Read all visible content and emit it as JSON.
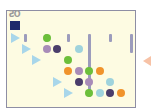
{
  "game": {
    "logo_text": "ƧO",
    "colors": {
      "board_bg": "#fdfbe2",
      "border": "#8e8ea4",
      "selected_square": "#1f2a6b",
      "launcher_triangle": "#a8d6ea",
      "exit_arrow": "#f7c2a6",
      "bar": "#9c9cbc",
      "green": "#6cbf3a",
      "purple": "#a88bb8",
      "dark_purple": "#4a3d6b",
      "light_blue": "#9fd3dc",
      "orange": "#f0932b"
    },
    "launchers": [
      {
        "row": 1,
        "col": 0
      },
      {
        "row": 2,
        "col": 1
      },
      {
        "row": 3,
        "col": 2
      },
      {
        "row": 5,
        "col": 4
      },
      {
        "row": 6,
        "col": 5
      }
    ],
    "bars": [
      {
        "col": 1,
        "row_start": 1,
        "row_end": 1
      },
      {
        "col": 3,
        "row_start": 1,
        "row_end": 1
      },
      {
        "col": 5,
        "row_start": 1,
        "row_end": 1
      },
      {
        "col": 7,
        "row_start": 1,
        "row_end": 6
      },
      {
        "col": 9,
        "row_start": 1,
        "row_end": 1
      },
      {
        "col": 11,
        "row_start": 1,
        "row_end": 2
      }
    ],
    "balls": [
      {
        "row": 1,
        "col": 3,
        "color": "green"
      },
      {
        "row": 2,
        "col": 3,
        "color": "purple"
      },
      {
        "row": 2,
        "col": 4,
        "color": "dark_purple"
      },
      {
        "row": 2,
        "col": 6,
        "color": "light_blue"
      },
      {
        "row": 3,
        "col": 5,
        "color": "green"
      },
      {
        "row": 4,
        "col": 5,
        "color": "orange"
      },
      {
        "row": 4,
        "col": 6,
        "color": "purple"
      },
      {
        "row": 4,
        "col": 7,
        "color": "green"
      },
      {
        "row": 4,
        "col": 8,
        "color": "orange"
      },
      {
        "row": 5,
        "col": 6,
        "color": "dark_purple"
      },
      {
        "row": 5,
        "col": 7,
        "color": "purple"
      },
      {
        "row": 5,
        "col": 9,
        "color": "light_blue"
      },
      {
        "row": 6,
        "col": 7,
        "color": "green"
      },
      {
        "row": 6,
        "col": 8,
        "color": "light_blue"
      },
      {
        "row": 6,
        "col": 9,
        "color": "dark_purple"
      },
      {
        "row": 6,
        "col": 10,
        "color": "orange"
      }
    ]
  }
}
